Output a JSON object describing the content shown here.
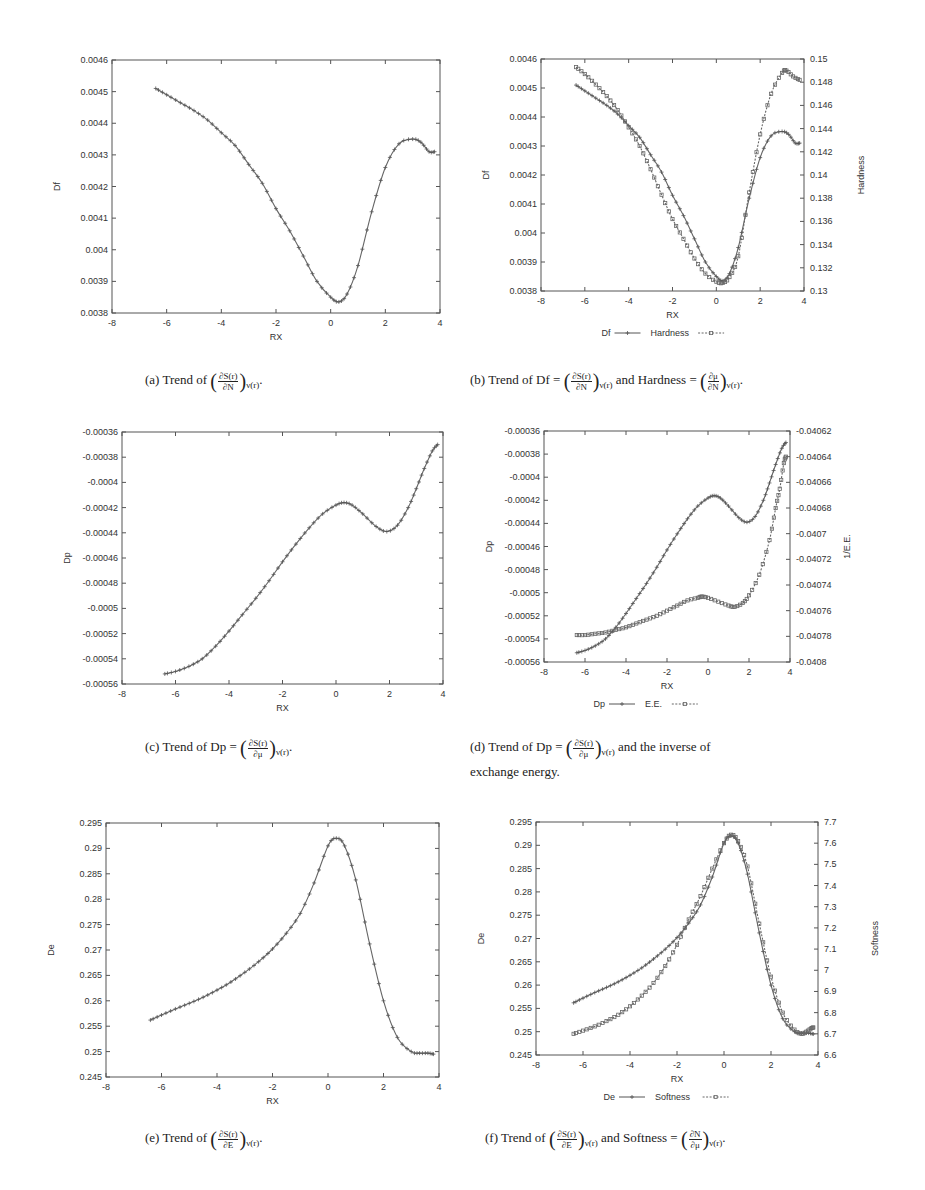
{
  "chart_data": [
    {
      "id": "a",
      "type": "line",
      "frame": {
        "x": 112,
        "y": 60,
        "w": 328,
        "h": 253
      },
      "xlabel": "RX",
      "ylabel": "Df",
      "xlim": [
        -8,
        4
      ],
      "ylim": [
        0.0038,
        0.0046
      ],
      "xticks": [
        -8,
        -6,
        -4,
        -2,
        0,
        2,
        4
      ],
      "yticks": [
        "0.0038",
        "0.0039",
        "0.004",
        "0.0041",
        "0.0042",
        "0.0043",
        "0.0044",
        "0.0045",
        "0.0046"
      ],
      "series": [
        {
          "name": "Df",
          "axis": "left",
          "marker": "plus",
          "dash": false,
          "x": [
            -6.4,
            -6.0,
            -5.5,
            -5.0,
            -4.5,
            -4.0,
            -3.5,
            -3.0,
            -2.5,
            -2.0,
            -1.5,
            -1.0,
            -0.5,
            0.0,
            0.3,
            0.6,
            1.0,
            1.5,
            2.0,
            2.5,
            3.0,
            3.3,
            3.6,
            3.8
          ],
          "y": [
            0.00451,
            0.00449,
            0.004465,
            0.00444,
            0.00441,
            0.00437,
            0.00433,
            0.00427,
            0.00421,
            0.00413,
            0.00406,
            0.00398,
            0.0039,
            0.00385,
            0.003835,
            0.00386,
            0.00395,
            0.00412,
            0.00426,
            0.004335,
            0.00435,
            0.00434,
            0.00431,
            0.00431
          ]
        }
      ],
      "caption": {
        "label": "(a) Trend of",
        "num": "∂S(r)",
        "den": "∂N",
        "sub": "ν(r)",
        "tail": "."
      }
    },
    {
      "id": "b",
      "type": "line",
      "frame": {
        "x": 541,
        "y": 59,
        "w": 263,
        "h": 232
      },
      "xlabel": "RX",
      "ylabel": "Df",
      "y2label": "Hardness",
      "xlim": [
        -8,
        4
      ],
      "ylim": [
        0.0038,
        0.0046
      ],
      "y2lim": [
        0.13,
        0.15
      ],
      "xticks": [
        -8,
        -6,
        -4,
        -2,
        0,
        2,
        4
      ],
      "yticks": [
        "0.0038",
        "0.0039",
        "0.004",
        "0.0041",
        "0.0042",
        "0.0043",
        "0.0044",
        "0.0045",
        "0.0046"
      ],
      "y2ticks": [
        "0.13",
        "0.132",
        "0.134",
        "0.136",
        "0.138",
        "0.14",
        "0.142",
        "0.144",
        "0.146",
        "0.148",
        "0.15"
      ],
      "legend": [
        "Df",
        "Hardness"
      ],
      "series": [
        {
          "name": "Df",
          "axis": "left",
          "marker": "plus",
          "dash": false,
          "x": [
            -6.4,
            -6.0,
            -5.5,
            -5.0,
            -4.5,
            -4.0,
            -3.5,
            -3.0,
            -2.5,
            -2.0,
            -1.5,
            -1.0,
            -0.5,
            0.0,
            0.3,
            0.6,
            1.0,
            1.5,
            2.0,
            2.5,
            3.0,
            3.3,
            3.6,
            3.8
          ],
          "y": [
            0.00451,
            0.00449,
            0.004465,
            0.00444,
            0.00441,
            0.00437,
            0.00433,
            0.00427,
            0.00421,
            0.00413,
            0.00406,
            0.00398,
            0.0039,
            0.00385,
            0.003835,
            0.00386,
            0.00395,
            0.00412,
            0.00426,
            0.004335,
            0.00435,
            0.00434,
            0.00431,
            0.00431
          ]
        },
        {
          "name": "Hardness",
          "axis": "right",
          "marker": "box",
          "dash": true,
          "x": [
            -6.4,
            -6.0,
            -5.5,
            -5.0,
            -4.5,
            -4.0,
            -3.5,
            -3.0,
            -2.5,
            -2.0,
            -1.5,
            -1.0,
            -0.5,
            0.0,
            0.3,
            0.6,
            1.0,
            1.5,
            2.0,
            2.5,
            3.0,
            3.2,
            3.5,
            3.8
          ],
          "y": [
            0.1493,
            0.1487,
            0.1478,
            0.1468,
            0.1456,
            0.1441,
            0.1425,
            0.1405,
            0.1383,
            0.1362,
            0.1345,
            0.1328,
            0.1315,
            0.1308,
            0.1307,
            0.1312,
            0.133,
            0.1385,
            0.1435,
            0.147,
            0.1488,
            0.149,
            0.1485,
            0.1482
          ]
        }
      ],
      "caption": {
        "label": "(b) Trend of Df =",
        "num": "∂S(r)",
        "den": "∂N",
        "sub": "ν(r)",
        "mid": "and Hardness =",
        "num2": "∂μ",
        "den2": "∂N",
        "sub2": "ν(r)",
        "tail": "."
      }
    },
    {
      "id": "c",
      "type": "line",
      "frame": {
        "x": 122,
        "y": 432,
        "w": 321,
        "h": 252
      },
      "xlabel": "RX",
      "ylabel": "Dp",
      "xlim": [
        -8,
        4
      ],
      "ylim": [
        -0.00056,
        -0.00036
      ],
      "xticks": [
        -8,
        -6,
        -4,
        -2,
        0,
        2,
        4
      ],
      "yticks": [
        "-0.00056",
        "-0.00054",
        "-0.00052",
        "-0.0005",
        "-0.00048",
        "-0.00046",
        "-0.00044",
        "-0.00042",
        "-0.0004",
        "-0.00038",
        "-0.00036"
      ],
      "series": [
        {
          "name": "Dp",
          "axis": "left",
          "marker": "plus",
          "dash": false,
          "x": [
            -6.4,
            -6.0,
            -5.5,
            -5.0,
            -4.5,
            -4.0,
            -3.5,
            -3.0,
            -2.5,
            -2.0,
            -1.5,
            -1.0,
            -0.5,
            0.0,
            0.3,
            0.6,
            1.0,
            1.5,
            1.9,
            2.3,
            2.7,
            3.0,
            3.3,
            3.6,
            3.8
          ],
          "y": [
            -0.000552,
            -0.00055,
            -0.000546,
            -0.00054,
            -0.00053,
            -0.000518,
            -0.000505,
            -0.000492,
            -0.000478,
            -0.000463,
            -0.000449,
            -0.000436,
            -0.000425,
            -0.000418,
            -0.000416,
            -0.000418,
            -0.000425,
            -0.000435,
            -0.000439,
            -0.000434,
            -0.00042,
            -0.000405,
            -0.000389,
            -0.000375,
            -0.00037
          ]
        }
      ],
      "caption": {
        "label": "(c) Trend of Dp =",
        "num": "∂S(r)",
        "den": "∂μ",
        "sub": "ν(r)",
        "tail": "."
      }
    },
    {
      "id": "d",
      "type": "line",
      "frame": {
        "x": 544,
        "y": 431,
        "w": 246,
        "h": 231
      },
      "xlabel": "RX",
      "ylabel": "Dp",
      "y2label": "1/E.E.",
      "xlim": [
        -8,
        4
      ],
      "ylim": [
        -0.00056,
        -0.00036
      ],
      "y2lim": [
        -0.0408,
        -0.04062
      ],
      "xticks": [
        -8,
        -6,
        -4,
        -2,
        0,
        2,
        4
      ],
      "yticks": [
        "-0.00056",
        "-0.00054",
        "-0.00052",
        "-0.0005",
        "-0.00048",
        "-0.00046",
        "-0.00044",
        "-0.00042",
        "-0.0004",
        "-0.00038",
        "-0.00036"
      ],
      "y2ticks": [
        "-0.0408",
        "-0.04078",
        "-0.04076",
        "-0.04074",
        "-0.04072",
        "-0.0407",
        "-0.04068",
        "-0.04066",
        "-0.04064",
        "-0.04062"
      ],
      "legend": [
        "Dp",
        "E.E."
      ],
      "series": [
        {
          "name": "Dp",
          "axis": "left",
          "marker": "plus",
          "dash": false,
          "x": [
            -6.4,
            -6.0,
            -5.5,
            -5.0,
            -4.5,
            -4.0,
            -3.5,
            -3.0,
            -2.5,
            -2.0,
            -1.5,
            -1.0,
            -0.5,
            0.0,
            0.3,
            0.6,
            1.0,
            1.5,
            1.9,
            2.3,
            2.7,
            3.0,
            3.3,
            3.6,
            3.8
          ],
          "y": [
            -0.000552,
            -0.00055,
            -0.000546,
            -0.00054,
            -0.00053,
            -0.000518,
            -0.000505,
            -0.000492,
            -0.000478,
            -0.000463,
            -0.000449,
            -0.000436,
            -0.000425,
            -0.000418,
            -0.000416,
            -0.000418,
            -0.000425,
            -0.000435,
            -0.000439,
            -0.000434,
            -0.00042,
            -0.000405,
            -0.000389,
            -0.000375,
            -0.00037
          ]
        },
        {
          "name": "E.E.",
          "axis": "right",
          "marker": "box",
          "dash": true,
          "x": [
            -6.4,
            -6.0,
            -5.5,
            -5.0,
            -4.5,
            -4.0,
            -3.5,
            -3.0,
            -2.5,
            -2.0,
            -1.5,
            -1.0,
            -0.5,
            -0.3,
            0.0,
            0.5,
            1.0,
            1.3,
            1.7,
            2.0,
            2.5,
            3.0,
            3.3,
            3.5,
            3.7,
            3.8
          ],
          "y": [
            -0.040779,
            -0.040779,
            -0.040778,
            -0.040777,
            -0.040775,
            -0.040773,
            -0.04077,
            -0.040767,
            -0.040764,
            -0.04076,
            -0.040756,
            -0.040752,
            -0.04075,
            -0.040749,
            -0.04075,
            -0.040753,
            -0.040756,
            -0.040757,
            -0.040754,
            -0.040748,
            -0.040732,
            -0.040705,
            -0.04068,
            -0.040665,
            -0.040645,
            -0.04064
          ]
        }
      ],
      "caption": {
        "label": "(d) Trend of Dp =",
        "num": "∂S(r)",
        "den": "∂μ",
        "sub": "ν(r)",
        "mid": "and the inverse of",
        "line2": "exchange energy."
      }
    },
    {
      "id": "e",
      "type": "line",
      "frame": {
        "x": 106,
        "y": 823,
        "w": 333,
        "h": 254
      },
      "xlabel": "RX",
      "ylabel": "De",
      "xlim": [
        -8,
        4
      ],
      "ylim": [
        0.245,
        0.295
      ],
      "xticks": [
        -8,
        -6,
        -4,
        -2,
        0,
        2,
        4
      ],
      "yticks": [
        "0.245",
        "0.25",
        "0.255",
        "0.26",
        "0.265",
        "0.27",
        "0.275",
        "0.28",
        "0.285",
        "0.29",
        "0.295"
      ],
      "series": [
        {
          "name": "De",
          "axis": "left",
          "marker": "plus",
          "dash": false,
          "x": [
            -6.4,
            -6.0,
            -5.5,
            -5.0,
            -4.5,
            -4.0,
            -3.5,
            -3.0,
            -2.5,
            -2.0,
            -1.5,
            -1.0,
            -0.5,
            0.0,
            0.3,
            0.6,
            1.0,
            1.5,
            2.0,
            2.5,
            3.0,
            3.3,
            3.6,
            3.8
          ],
          "y": [
            0.2562,
            0.2572,
            0.2584,
            0.2595,
            0.2607,
            0.2621,
            0.2637,
            0.2656,
            0.2677,
            0.2702,
            0.2733,
            0.2772,
            0.2832,
            0.2905,
            0.292,
            0.2905,
            0.2838,
            0.2712,
            0.26,
            0.2528,
            0.25,
            0.2497,
            0.2497,
            0.2495
          ]
        }
      ],
      "caption": {
        "label": "(e) Trend of",
        "num": "∂S(r)",
        "den": "∂E",
        "sub": "ν(r)",
        "tail": "."
      }
    },
    {
      "id": "f",
      "type": "line",
      "frame": {
        "x": 536,
        "y": 822,
        "w": 282,
        "h": 233
      },
      "xlabel": "RX",
      "ylabel": "De",
      "y2label": "Softness",
      "xlim": [
        -8,
        4
      ],
      "ylim": [
        0.245,
        0.295
      ],
      "y2lim": [
        6.6,
        7.7
      ],
      "xticks": [
        -8,
        -6,
        -4,
        -2,
        0,
        2,
        4
      ],
      "yticks": [
        "0.245",
        "0.25",
        "0.255",
        "0.26",
        "0.265",
        "0.27",
        "0.275",
        "0.28",
        "0.285",
        "0.29",
        "0.295"
      ],
      "y2ticks": [
        "6.6",
        "6.7",
        "6.8",
        "6.9",
        "7",
        "7.1",
        "7.2",
        "7.3",
        "7.4",
        "7.5",
        "7.6",
        "7.7"
      ],
      "legend": [
        "De",
        "Softness"
      ],
      "series": [
        {
          "name": "De",
          "axis": "left",
          "marker": "plus",
          "dash": false,
          "x": [
            -6.4,
            -6.0,
            -5.5,
            -5.0,
            -4.5,
            -4.0,
            -3.5,
            -3.0,
            -2.5,
            -2.0,
            -1.5,
            -1.0,
            -0.5,
            0.0,
            0.3,
            0.6,
            1.0,
            1.5,
            2.0,
            2.5,
            3.0,
            3.3,
            3.6,
            3.8
          ],
          "y": [
            0.2562,
            0.2572,
            0.2584,
            0.2595,
            0.2607,
            0.2621,
            0.2637,
            0.2656,
            0.2677,
            0.2702,
            0.2733,
            0.2772,
            0.2832,
            0.2905,
            0.292,
            0.2905,
            0.2838,
            0.2712,
            0.26,
            0.2528,
            0.25,
            0.2497,
            0.2497,
            0.2495
          ]
        },
        {
          "name": "Softness",
          "axis": "right",
          "marker": "box",
          "dash": true,
          "x": [
            -6.4,
            -6.0,
            -5.5,
            -5.0,
            -4.5,
            -4.0,
            -3.5,
            -3.0,
            -2.5,
            -2.0,
            -1.5,
            -1.0,
            -0.5,
            0.0,
            0.3,
            0.6,
            1.0,
            1.5,
            2.0,
            2.5,
            3.0,
            3.3,
            3.5,
            3.7,
            3.8
          ],
          "y": [
            6.7,
            6.715,
            6.735,
            6.76,
            6.79,
            6.83,
            6.88,
            6.94,
            7.02,
            7.12,
            7.24,
            7.35,
            7.48,
            7.6,
            7.64,
            7.61,
            7.49,
            7.22,
            6.97,
            6.8,
            6.72,
            6.7,
            6.71,
            6.725,
            6.73
          ]
        }
      ],
      "caption": {
        "label": "(f) Trend of",
        "num": "∂S(r)",
        "den": "∂E",
        "sub": "ν(r)",
        "mid": "and Softness =",
        "num2": "∂N",
        "den2": "∂μ",
        "sub2": "ν(r)",
        "tail": "."
      }
    }
  ]
}
